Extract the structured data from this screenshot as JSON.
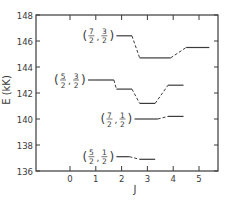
{
  "chart_data": {
    "type": "line",
    "title": "",
    "xlabel": "J",
    "ylabel": "E (kK)",
    "xlim": [
      -1.35,
      5.75
    ],
    "ylim": [
      136,
      148
    ],
    "xticks": [
      0,
      1,
      2,
      3,
      4,
      5
    ],
    "yticks": [
      136,
      138,
      140,
      142,
      144,
      146,
      148
    ],
    "xtick_labels": [
      "0",
      "1",
      "2",
      "3",
      "4",
      "5"
    ],
    "ytick_labels": [
      "136",
      "138",
      "140",
      "142",
      "144",
      "146",
      "148"
    ],
    "grid": false,
    "series": [
      {
        "name": "(7/2, 3/2)",
        "label_num1": "7",
        "label_num2": "3",
        "segments": [
          {
            "x": [
              1.8,
              2.4
            ],
            "y": 146.4
          },
          {
            "x": [
              2.7,
              3.9
            ],
            "y": 144.7
          },
          {
            "x": [
              4.5,
              5.4
            ],
            "y": 145.5
          }
        ]
      },
      {
        "name": "(5/2, 3/2)",
        "label_num1": "5",
        "label_num2": "3",
        "segments": [
          {
            "x": [
              0.7,
              1.7
            ],
            "y": 143.0
          },
          {
            "x": [
              1.8,
              2.4
            ],
            "y": 142.3
          },
          {
            "x": [
              2.7,
              3.3
            ],
            "y": 141.2
          },
          {
            "x": [
              3.8,
              4.4
            ],
            "y": 142.6
          }
        ]
      },
      {
        "name": "(7/2, 1/2)",
        "label_num1": "7",
        "label_num2": "1",
        "segments": [
          {
            "x": [
              2.5,
              3.4
            ],
            "y": 140.0
          },
          {
            "x": [
              3.8,
              4.4
            ],
            "y": 140.2
          }
        ]
      },
      {
        "name": "(5/2, 1/2)",
        "label_num1": "5",
        "label_num2": "1",
        "segments": [
          {
            "x": [
              1.8,
              2.3
            ],
            "y": 137.1
          },
          {
            "x": [
              2.7,
              3.3
            ],
            "y": 136.9
          }
        ]
      }
    ]
  },
  "axes": {
    "xlabel": "J",
    "ylabel": "E (kK)"
  }
}
